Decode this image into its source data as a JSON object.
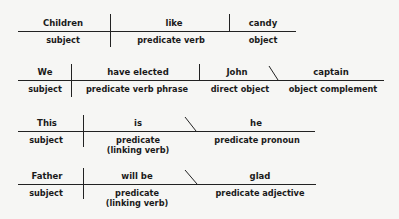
{
  "diagrams": [
    {
      "id": "children-like-candy",
      "parts": [
        {
          "word": "Children",
          "label": "subject"
        },
        {
          "word": "like",
          "label": "predicate verb"
        },
        {
          "word": "candy",
          "label": "object"
        }
      ]
    },
    {
      "id": "we-have-elected-john-captain",
      "parts": [
        {
          "word": "We",
          "label": "subject"
        },
        {
          "word": "have elected",
          "label": "predicate verb phrase"
        },
        {
          "word": "John",
          "label": "direct object"
        },
        {
          "word": "captain",
          "label": "object complement"
        }
      ]
    },
    {
      "id": "this-is-he",
      "parts": [
        {
          "word": "This",
          "label": "subject"
        },
        {
          "word": "is",
          "label": "predicate",
          "label2": "(linking verb)"
        },
        {
          "word": "he",
          "label": "predicate pronoun"
        }
      ]
    },
    {
      "id": "father-will-be-glad",
      "parts": [
        {
          "word": "Father",
          "label": "subject"
        },
        {
          "word": "will be",
          "label": "predicate",
          "label2": "(linking verb)"
        },
        {
          "word": "glad",
          "label": "predicate adjective"
        }
      ]
    }
  ]
}
